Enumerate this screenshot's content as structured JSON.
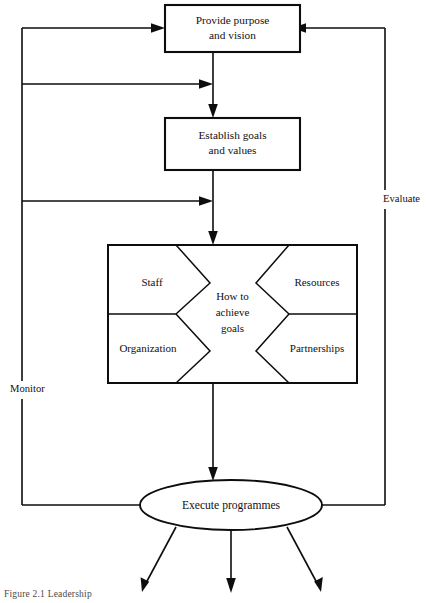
{
  "figure": {
    "caption": "Figure 2.1  Leadership",
    "ink_color": "#0d0d0d",
    "background_color": "#ffffff"
  },
  "nodes": {
    "provide_purpose": {
      "line1": "Provide purpose",
      "line2": "and vision"
    },
    "establish_goals": {
      "line1": "Establish goals",
      "line2": "and values"
    },
    "how_to_achieve": {
      "line1": "How to",
      "line2": "achieve",
      "line3": "goals"
    },
    "quadrants": {
      "top_left": "Staff",
      "bottom_left": "Organization",
      "top_right": "Resources",
      "bottom_right": "Partnerships"
    },
    "execute": {
      "label": "Execute programmes"
    }
  },
  "feedback_labels": {
    "left": "Monitor",
    "right": "Evaluate"
  }
}
